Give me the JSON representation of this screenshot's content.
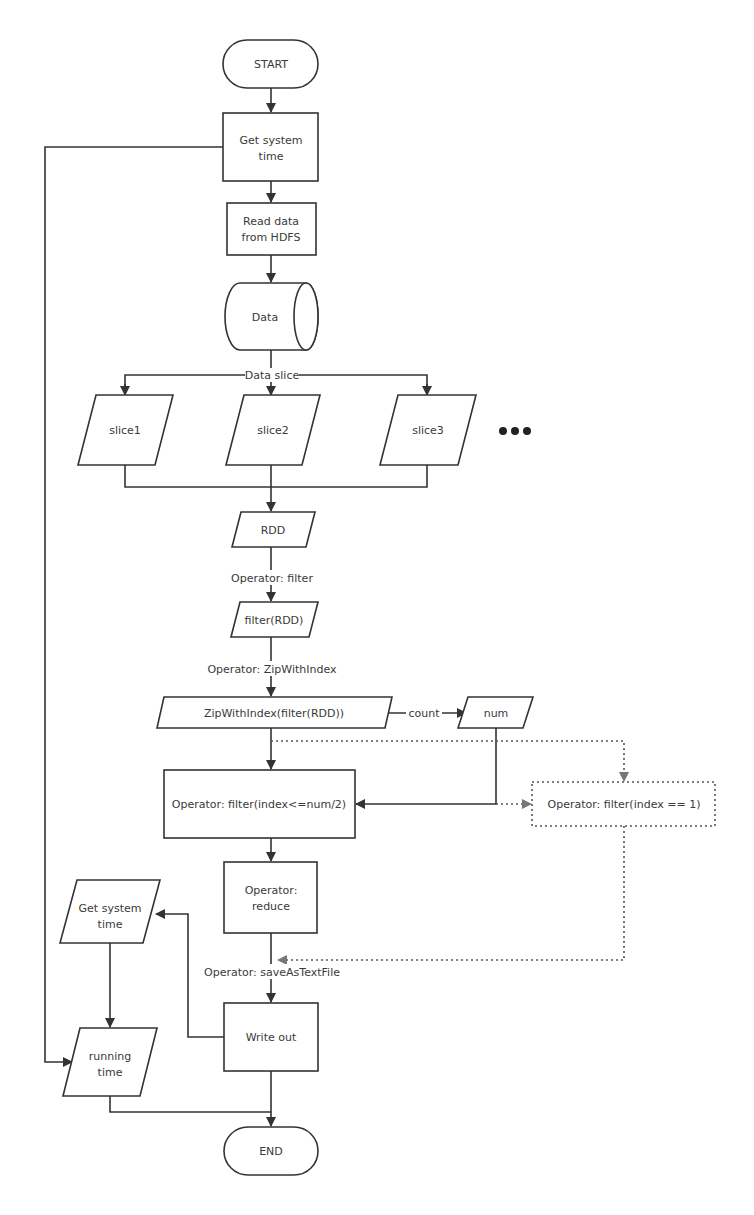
{
  "nodes": {
    "start": "START",
    "get_time_1": [
      "Get system",
      "time"
    ],
    "read_data": [
      "Read data",
      "from HDFS"
    ],
    "data": "Data",
    "slice1": "slice1",
    "slice2": "slice2",
    "slice3": "slice3",
    "ellipsis": "•••",
    "rdd": "RDD",
    "filter_rdd": "filter(RDD)",
    "zip": "ZipWithIndex(filter(RDD))",
    "num": "num",
    "filter_half": "Operator: filter(index<=num/2)",
    "filter_one": "Operator: filter(index == 1)",
    "reduce": [
      "Operator:",
      "reduce"
    ],
    "write_out": "Write out",
    "get_time_2": [
      "Get system",
      "time"
    ],
    "running_time": [
      "running",
      "time"
    ],
    "end": "END"
  },
  "edge_labels": {
    "data_slice": "Data slice",
    "op_filter": "Operator: filter",
    "op_zip": "Operator: ZipWithIndex",
    "count": "count",
    "op_save": "Operator: saveAsTextFile"
  },
  "colors": {
    "stroke": "#333333",
    "dotted": "#555555",
    "text": "#3a3a3a"
  }
}
